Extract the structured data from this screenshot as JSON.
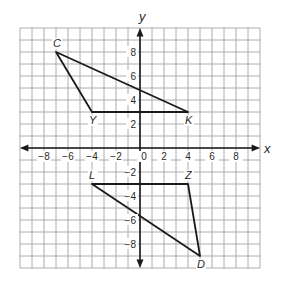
{
  "diagram": {
    "type": "coordinate-plane",
    "axes": {
      "x_label": "x",
      "y_label": "y",
      "range": [
        -10,
        10
      ],
      "tick_step": 2
    },
    "x_ticks": [
      "−8",
      "−6",
      "−4",
      "−2",
      "0",
      "2",
      "4",
      "6",
      "8"
    ],
    "y_ticks": [
      "8",
      "6",
      "4",
      "2",
      "−2",
      "−4",
      "−6",
      "−8"
    ],
    "figures": [
      {
        "name": "triangle CYK",
        "vertices": [
          {
            "label": "C",
            "x": -7,
            "y": 8
          },
          {
            "label": "Y",
            "x": -4,
            "y": 3
          },
          {
            "label": "K",
            "x": 4,
            "y": 3
          }
        ]
      },
      {
        "name": "triangle LZD",
        "vertices": [
          {
            "label": "L",
            "x": -4,
            "y": -3
          },
          {
            "label": "Z",
            "x": 4,
            "y": -3
          },
          {
            "label": "D",
            "x": 5,
            "y": -9
          }
        ]
      }
    ],
    "colors": {
      "grid": "#9a9a9a",
      "axis": "#1a1a1a",
      "figure": "#1a1a1a"
    }
  }
}
